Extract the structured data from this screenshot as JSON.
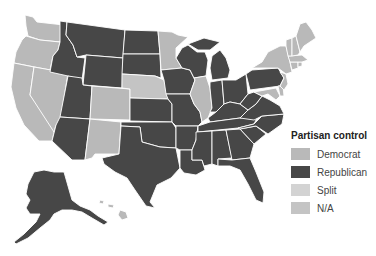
{
  "colors": {
    "democrat": "#b9b9b9",
    "republican": "#474747",
    "split": "#d3d3d3",
    "na": "#c4c4c4"
  },
  "legend": {
    "title": "Partisan control",
    "items": [
      {
        "key": "democrat",
        "label": "Democrat",
        "color": "#b9b9b9"
      },
      {
        "key": "republican",
        "label": "Republican",
        "color": "#474747"
      },
      {
        "key": "split",
        "label": "Split",
        "color": "#d3d3d3"
      },
      {
        "key": "na",
        "label": "N/A",
        "color": "#c4c4c4"
      }
    ]
  },
  "states": {
    "WA": "democrat",
    "OR": "democrat",
    "CA": "democrat",
    "NV": "democrat",
    "ID": "republican",
    "MT": "republican",
    "WY": "republican",
    "UT": "republican",
    "AZ": "republican",
    "CO": "democrat",
    "NM": "democrat",
    "ND": "republican",
    "SD": "republican",
    "NE": "na",
    "KS": "republican",
    "OK": "republican",
    "TX": "republican",
    "MN": "democrat",
    "IA": "republican",
    "MO": "republican",
    "AR": "republican",
    "LA": "republican",
    "WI": "republican",
    "IL": "democrat",
    "MI": "republican",
    "IN": "republican",
    "OH": "republican",
    "KY": "republican",
    "TN": "republican",
    "MS": "republican",
    "AL": "republican",
    "GA": "republican",
    "FL": "republican",
    "SC": "republican",
    "NC": "republican",
    "VA": "republican",
    "WV": "republican",
    "PA": "republican",
    "NY": "democrat",
    "VT": "democrat",
    "NH": "democrat",
    "ME": "democrat",
    "MA": "democrat",
    "CT": "democrat",
    "RI": "democrat",
    "NJ": "democrat",
    "DE": "democrat",
    "MD": "democrat",
    "AK": "republican",
    "HI": "democrat"
  }
}
